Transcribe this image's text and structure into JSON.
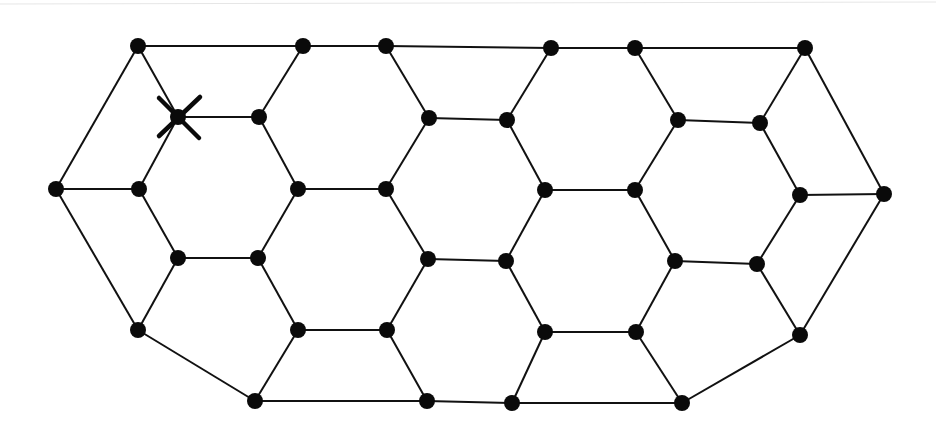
{
  "diagram": {
    "type": "graph",
    "colors": {
      "edge": "#111111",
      "node": "#0a0a0a",
      "background": "#ffffff"
    },
    "nodes": [
      {
        "id": "A",
        "x": 138,
        "y": 46
      },
      {
        "id": "B",
        "x": 303,
        "y": 46
      },
      {
        "id": "C",
        "x": 386,
        "y": 46
      },
      {
        "id": "D",
        "x": 551,
        "y": 48
      },
      {
        "id": "E",
        "x": 635,
        "y": 48
      },
      {
        "id": "F",
        "x": 805,
        "y": 48
      },
      {
        "id": "G",
        "x": 178,
        "y": 117,
        "marked": true
      },
      {
        "id": "H",
        "x": 259,
        "y": 117
      },
      {
        "id": "I",
        "x": 429,
        "y": 118
      },
      {
        "id": "J",
        "x": 507,
        "y": 120
      },
      {
        "id": "K",
        "x": 678,
        "y": 120
      },
      {
        "id": "L",
        "x": 760,
        "y": 123
      },
      {
        "id": "M",
        "x": 56,
        "y": 189
      },
      {
        "id": "N",
        "x": 139,
        "y": 189
      },
      {
        "id": "O",
        "x": 298,
        "y": 189
      },
      {
        "id": "P",
        "x": 386,
        "y": 189
      },
      {
        "id": "Q",
        "x": 545,
        "y": 190
      },
      {
        "id": "R",
        "x": 635,
        "y": 190
      },
      {
        "id": "S",
        "x": 800,
        "y": 195
      },
      {
        "id": "T",
        "x": 884,
        "y": 194
      },
      {
        "id": "U",
        "x": 178,
        "y": 258
      },
      {
        "id": "V",
        "x": 258,
        "y": 258
      },
      {
        "id": "W",
        "x": 428,
        "y": 259
      },
      {
        "id": "X",
        "x": 506,
        "y": 261
      },
      {
        "id": "Y",
        "x": 675,
        "y": 261
      },
      {
        "id": "Z",
        "x": 757,
        "y": 264
      },
      {
        "id": "a",
        "x": 138,
        "y": 330
      },
      {
        "id": "b",
        "x": 298,
        "y": 330
      },
      {
        "id": "c",
        "x": 387,
        "y": 330
      },
      {
        "id": "d",
        "x": 545,
        "y": 332
      },
      {
        "id": "e",
        "x": 636,
        "y": 332
      },
      {
        "id": "f",
        "x": 800,
        "y": 335
      },
      {
        "id": "g",
        "x": 255,
        "y": 401
      },
      {
        "id": "h",
        "x": 427,
        "y": 401
      },
      {
        "id": "i",
        "x": 512,
        "y": 403
      },
      {
        "id": "j",
        "x": 682,
        "y": 403
      }
    ],
    "edges": [
      [
        "A",
        "B"
      ],
      [
        "B",
        "C"
      ],
      [
        "C",
        "D"
      ],
      [
        "D",
        "E"
      ],
      [
        "E",
        "F"
      ],
      [
        "A",
        "M"
      ],
      [
        "A",
        "G"
      ],
      [
        "B",
        "H"
      ],
      [
        "C",
        "I"
      ],
      [
        "D",
        "J"
      ],
      [
        "E",
        "K"
      ],
      [
        "F",
        "L"
      ],
      [
        "F",
        "T"
      ],
      [
        "G",
        "H"
      ],
      [
        "I",
        "J"
      ],
      [
        "K",
        "L"
      ],
      [
        "G",
        "N"
      ],
      [
        "H",
        "O"
      ],
      [
        "I",
        "P"
      ],
      [
        "J",
        "Q"
      ],
      [
        "K",
        "R"
      ],
      [
        "L",
        "S"
      ],
      [
        "M",
        "N"
      ],
      [
        "O",
        "P"
      ],
      [
        "Q",
        "R"
      ],
      [
        "S",
        "T"
      ],
      [
        "M",
        "a"
      ],
      [
        "N",
        "U"
      ],
      [
        "O",
        "V"
      ],
      [
        "P",
        "W"
      ],
      [
        "Q",
        "X"
      ],
      [
        "R",
        "Y"
      ],
      [
        "S",
        "Z"
      ],
      [
        "T",
        "f"
      ],
      [
        "U",
        "V"
      ],
      [
        "W",
        "X"
      ],
      [
        "Y",
        "Z"
      ],
      [
        "U",
        "a"
      ],
      [
        "V",
        "b"
      ],
      [
        "W",
        "c"
      ],
      [
        "X",
        "d"
      ],
      [
        "Y",
        "e"
      ],
      [
        "Z",
        "f"
      ],
      [
        "b",
        "c"
      ],
      [
        "d",
        "e"
      ],
      [
        "a",
        "g"
      ],
      [
        "b",
        "g"
      ],
      [
        "c",
        "h"
      ],
      [
        "d",
        "i"
      ],
      [
        "e",
        "j"
      ],
      [
        "f",
        "j"
      ],
      [
        "g",
        "h"
      ],
      [
        "h",
        "i"
      ],
      [
        "i",
        "j"
      ]
    ],
    "marker": {
      "node": "G",
      "symbol": "X"
    }
  }
}
